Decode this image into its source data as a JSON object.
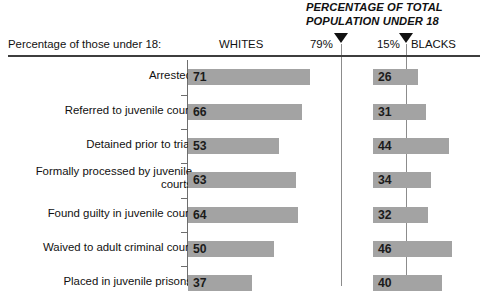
{
  "header": {
    "super_title": "PERCENTAGE OF TOTAL\nPOPULATION UNDER 18",
    "axis_caption": "Percentage of those under 18:",
    "col_whites": "WHITES",
    "col_blacks": "BLACKS",
    "marker_white_pct": "79%",
    "marker_black_pct": "15%"
  },
  "chart_data": {
    "type": "bar",
    "title": "PERCENTAGE OF TOTAL POPULATION UNDER 18",
    "xlabel": "Percentage of those under 18:",
    "ylabel": "",
    "orientation": "horizontal",
    "grid": false,
    "legend_position": "top",
    "xlim": [
      0,
      100
    ],
    "annotations": [
      {
        "label": "79%",
        "series": "WHITES",
        "meaning": "percentage of total population under 18"
      },
      {
        "label": "15%",
        "series": "BLACKS",
        "meaning": "percentage of total population under 18"
      }
    ],
    "categories": [
      "Arrested",
      "Referred to juvenile court",
      "Detained prior to trial",
      "Formally processed by juvenile courts",
      "Found guilty in juvenile court",
      "Waived to adult criminal court",
      "Placed in juvenile prisons"
    ],
    "series": [
      {
        "name": "WHITES",
        "values": [
          71,
          66,
          53,
          63,
          64,
          50,
          37
        ]
      },
      {
        "name": "BLACKS",
        "values": [
          26,
          31,
          44,
          34,
          32,
          46,
          40
        ]
      }
    ]
  },
  "rows": [
    {
      "label": "Arrested",
      "white": "71",
      "black": "26",
      "white_v": 71,
      "black_v": 26,
      "top": 69,
      "label_top": 69,
      "lines": 1
    },
    {
      "label": "Referred to juvenile court",
      "white": "66",
      "black": "31",
      "white_v": 66,
      "black_v": 31,
      "top": 104,
      "label_top": 104,
      "lines": 1
    },
    {
      "label": "Detained prior to trial",
      "white": "53",
      "black": "44",
      "white_v": 53,
      "black_v": 44,
      "top": 138,
      "label_top": 138,
      "lines": 1
    },
    {
      "label": "Formally processed by juvenile courts",
      "white": "63",
      "black": "34",
      "white_v": 63,
      "black_v": 34,
      "top": 172,
      "label_top": 165,
      "lines": 2
    },
    {
      "label": "Found guilty in juvenile court",
      "white": "64",
      "black": "32",
      "white_v": 64,
      "black_v": 32,
      "top": 207,
      "label_top": 207,
      "lines": 1
    },
    {
      "label": "Waived to adult criminal court",
      "white": "50",
      "black": "46",
      "white_v": 50,
      "black_v": 46,
      "top": 241,
      "label_top": 241,
      "lines": 1
    },
    {
      "label": "Placed in juvenile prisons",
      "white": "37",
      "black": "40",
      "white_v": 37,
      "black_v": 40,
      "top": 275,
      "label_top": 275,
      "lines": 1
    }
  ],
  "style": {
    "bar_color": "#a3a3a3",
    "rule_color": "#3d3d3d",
    "guide_color": "#8c8c8c",
    "text_color": "#111111",
    "px_per_unit": 1.72
  }
}
